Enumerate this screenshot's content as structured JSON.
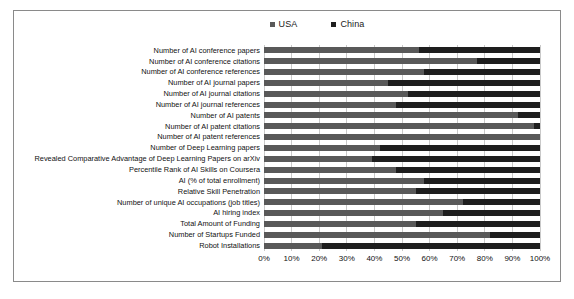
{
  "chart_data": {
    "type": "bar",
    "subtype": "100% stacked horizontal bar",
    "title": "",
    "subtitle": "",
    "xlabel": "",
    "ylabel": "",
    "xlim": [
      0,
      100
    ],
    "grid": true,
    "legend_position": "top-center",
    "xtick_labels": [
      "0%",
      "10%",
      "20%",
      "30%",
      "40%",
      "50%",
      "60%",
      "70%",
      "80%",
      "90%",
      "100%"
    ],
    "xtick_values": [
      0,
      10,
      20,
      30,
      40,
      50,
      60,
      70,
      80,
      90,
      100
    ],
    "categories": [
      "Number of AI conference papers",
      "Number of AI conference citations",
      "Number of AI conference references",
      "Number of AI journal papers",
      "Number of AI journal citations",
      "Number of AI journal references",
      "Number of AI patents",
      "Number of AI patent citations",
      "Number of AI patent references",
      "Number of Deep Learning papers",
      "Revealed Comparative Advantage of Deep Learning Papers on arXiv",
      "Percentile Rank of AI Skills on Coursera",
      "AI (% of total enrollment)",
      "Relative Skill Penetration",
      "Number of unique AI occupations (job titles)",
      "AI hiring index",
      "Total Amount of Funding",
      "Number of Startups Funded",
      "Robot Installations"
    ],
    "series": [
      {
        "name": "USA",
        "color": "#595959",
        "values": [
          56,
          77,
          58,
          45,
          52,
          48,
          92,
          98,
          100,
          42,
          39,
          48,
          58,
          55,
          72,
          65,
          55,
          82,
          21
        ]
      },
      {
        "name": "China",
        "color": "#1e1e1e",
        "values": [
          44,
          23,
          42,
          55,
          48,
          52,
          8,
          2,
          0,
          58,
          61,
          52,
          42,
          45,
          28,
          35,
          45,
          18,
          79
        ]
      }
    ]
  },
  "legend": {
    "entries": [
      {
        "label": "USA",
        "color": "#595959"
      },
      {
        "label": "China",
        "color": "#1e1e1e"
      }
    ]
  }
}
